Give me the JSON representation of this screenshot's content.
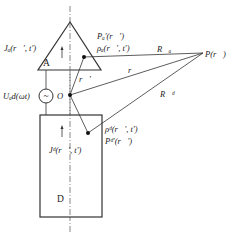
{
  "diagram": {
    "labels": {
      "body_a": "A",
      "body_d": "D",
      "origin": "O",
      "point_p": "P(r⃗)",
      "source": "Uₐd(ωt)",
      "j_a": "Jₐ(r⃗′, t′)",
      "j_d": "Jᵈ(r⃗′, t′)",
      "p_a": "Pₐ′(r⃗′)",
      "rho_a": "ρₐ(r⃗′, t′)",
      "rho_d": "ρᵈ(r⃗′, t′)",
      "p_d": "Pᵈ′(r⃗′)",
      "r_prime": "r⃗′",
      "r": "r⃗",
      "R_a": "R⃗ₐ",
      "R_d": "R⃗ᵈ",
      "source_symbol": "~"
    }
  }
}
